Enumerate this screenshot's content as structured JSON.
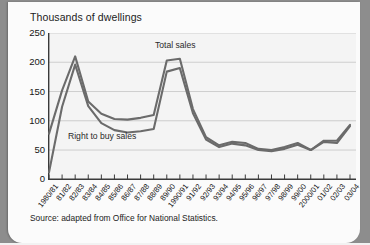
{
  "chart_title": "Thousands of dwellings",
  "source_note": "Source:  adapted from Office for National Statistics.",
  "annotations": {
    "total": "Total sales",
    "right_to_buy": "Right to buy sales"
  },
  "chart_data": {
    "type": "line",
    "title": "Thousands of dwellings",
    "xlabel": "",
    "ylabel": "Thousands of dwellings",
    "ylim": [
      0,
      250
    ],
    "yticks": [
      0,
      50,
      100,
      150,
      200,
      250
    ],
    "ytick_labels": [
      "0",
      "50",
      "100",
      "150",
      "200",
      "250"
    ],
    "grid": true,
    "legend": "inline-annotations",
    "categories": [
      "1980/81",
      "81/82",
      "82/83",
      "83/84",
      "84/85",
      "85/86",
      "86/87",
      "87/88",
      "88/89",
      "89/90",
      "1990/91",
      "91/92",
      "92/93",
      "93/94",
      "94/95",
      "95/96",
      "96/97",
      "97/98",
      "98/99",
      "99/00",
      "2000/01",
      "01/02",
      "02/03",
      "03/04"
    ],
    "series": [
      {
        "name": "Total sales",
        "values": [
          78,
          152,
          210,
          133,
          112,
          103,
          102,
          105,
          110,
          203,
          206,
          120,
          72,
          58,
          64,
          62,
          52,
          50,
          55,
          62,
          50,
          66,
          66,
          93
        ]
      },
      {
        "name": "Right to buy sales",
        "values": [
          12,
          124,
          196,
          125,
          96,
          84,
          80,
          82,
          86,
          184,
          190,
          113,
          68,
          55,
          61,
          58,
          50,
          48,
          52,
          59,
          50,
          64,
          62,
          91
        ]
      }
    ]
  }
}
